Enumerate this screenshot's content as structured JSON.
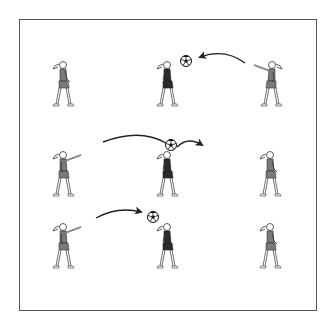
{
  "diagram": {
    "caption": "Ball passing drill: nine players in a 3x3 grid",
    "colors": {
      "border": "#555555",
      "line": "#222222",
      "dress_light": "#7a7a7a",
      "dress_dark": "#2a2a2a",
      "ball": "#111111"
    },
    "players": [
      {
        "id": "p1",
        "x": 63,
        "y": 92,
        "pose": "standing",
        "facing": "right",
        "dress": "light"
      },
      {
        "id": "p2",
        "x": 167,
        "y": 92,
        "pose": "standing",
        "facing": "right",
        "dress": "dark"
      },
      {
        "id": "p3",
        "x": 268,
        "y": 92,
        "pose": "throwing",
        "facing": "left",
        "dress": "light"
      },
      {
        "id": "p4",
        "x": 63,
        "y": 182,
        "pose": "throwing",
        "facing": "right",
        "dress": "light"
      },
      {
        "id": "p5",
        "x": 167,
        "y": 182,
        "pose": "standing",
        "facing": "right",
        "dress": "dark"
      },
      {
        "id": "p6",
        "x": 268,
        "y": 182,
        "pose": "standing",
        "facing": "left",
        "dress": "light"
      },
      {
        "id": "p7",
        "x": 63,
        "y": 254,
        "pose": "throwing",
        "facing": "right",
        "dress": "light"
      },
      {
        "id": "p8",
        "x": 167,
        "y": 254,
        "pose": "standing",
        "facing": "right",
        "dress": "dark"
      },
      {
        "id": "p9",
        "x": 268,
        "y": 254,
        "pose": "standing",
        "facing": "left",
        "dress": "light"
      }
    ],
    "balls": [
      {
        "id": "b1",
        "x": 186,
        "y": 61
      },
      {
        "id": "b2",
        "x": 171,
        "y": 145
      },
      {
        "id": "b3",
        "x": 153,
        "y": 217
      }
    ],
    "arrows": [
      {
        "id": "a1",
        "path": "M245,63 Q225,48 200,57",
        "label": "pass from right player to middle top"
      },
      {
        "id": "a2",
        "path": "M103,142 Q140,128 168,145",
        "label": "long pass over middle"
      },
      {
        "id": "a3",
        "path": "M178,146 Q188,137 202,145",
        "label": "continuation to the right"
      },
      {
        "id": "a4",
        "path": "M96,218 Q118,206 140,212",
        "label": "pass from bottom-left player"
      }
    ]
  }
}
